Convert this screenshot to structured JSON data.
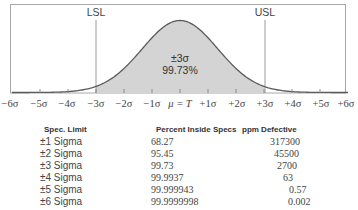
{
  "chart_data": {
    "type": "area",
    "title": "",
    "x_ticks": [
      "-6σ",
      "-5σ",
      "-4σ",
      "-3σ",
      "-2σ",
      "-1σ",
      "μ = T",
      "+1σ",
      "+2σ",
      "+3σ",
      "+4σ",
      "+5σ",
      "+6σ"
    ],
    "x_range": [
      -6,
      6
    ],
    "lower_spec_limit": {
      "label": "LSL",
      "position": -3
    },
    "upper_spec_limit": {
      "label": "USL",
      "position": 3
    },
    "shaded_region": [
      -3,
      3
    ],
    "shaded_annotation": [
      "±3σ",
      "99.73%"
    ],
    "grid": false,
    "colors": {
      "curve": "#555555",
      "shade": "#d6d6d6",
      "limit_line": "#9a9a9a",
      "frame": "#a0a0a0"
    },
    "table": {
      "columns": [
        "Spec. Limit",
        "Percent Inside Specs",
        "ppm Defective"
      ],
      "rows": [
        [
          "±1 Sigma",
          "68.27",
          "317300"
        ],
        [
          "±2 Sigma",
          "95.45",
          "45500"
        ],
        [
          "±3 Sigma",
          "99.73",
          "2700"
        ],
        [
          "±4 Sigma",
          "99.9937",
          "63"
        ],
        [
          "±5 Sigma",
          "99.999943",
          "0.57"
        ],
        [
          "±6 Sigma",
          "99.9999998",
          "0.002"
        ]
      ]
    }
  },
  "chart": {
    "lsl_label": "LSL",
    "usl_label": "USL",
    "center_line1": "±3σ",
    "center_line2": "99.73%",
    "ticks": {
      "t0": "−6σ",
      "t1": "−5σ",
      "t2": "−4σ",
      "t3": "−3σ",
      "t4": "−2σ",
      "t5": "−1σ",
      "t6": "μ = T",
      "t7": "+1σ",
      "t8": "+2σ",
      "t9": "+3σ",
      "t10": "+4σ",
      "t11": "+5σ",
      "t12": "+6σ"
    }
  },
  "table": {
    "headers": {
      "spec_limit": "Spec. Limit",
      "percent_inside": "Percent Inside Specs",
      "ppm_defective": "ppm Defective"
    },
    "rows": [
      {
        "spec": "±1 Sigma",
        "percent": "68.27",
        "ppm": "317300"
      },
      {
        "spec": "±2 Sigma",
        "percent": "95.45",
        "ppm": "45500"
      },
      {
        "spec": "±3 Sigma",
        "percent": "99.73",
        "ppm": "2700"
      },
      {
        "spec": "±4 Sigma",
        "percent": "99.9937",
        "ppm": "63"
      },
      {
        "spec": "±5 Sigma",
        "percent": "99.999943",
        "ppm": "0.57"
      },
      {
        "spec": "±6 Sigma",
        "percent": "99.9999998",
        "ppm": "0.002"
      }
    ]
  }
}
